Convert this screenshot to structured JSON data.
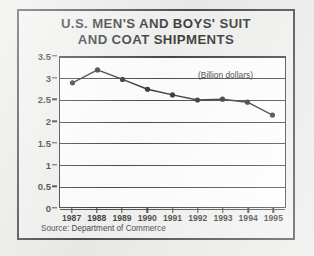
{
  "figure": {
    "title_line1": "U.S. MEN'S AND BOYS' SUIT",
    "title_line2": "AND COAT SHIPMENTS",
    "source_note": "Source:  Department of Commerce",
    "frame_color": "#26262a",
    "background_color": "#efefed",
    "page_background": "#e8e8e6",
    "line_color": "#111114"
  },
  "chart_data": {
    "type": "line",
    "title": "U.S. MEN'S AND BOYS' SUIT AND COAT SHIPMENTS",
    "subtitle": "",
    "annotation": "(Billion dollars)",
    "xlabel": "",
    "ylabel": "",
    "categories": [
      "1987",
      "1988",
      "1989",
      "1990",
      "1991",
      "1992",
      "1993",
      "1994",
      "1995"
    ],
    "values": [
      2.9,
      3.2,
      2.98,
      2.75,
      2.62,
      2.5,
      2.52,
      2.45,
      2.15
    ],
    "series": [
      {
        "name": "Shipments",
        "values": [
          2.9,
          3.2,
          2.98,
          2.75,
          2.62,
          2.5,
          2.52,
          2.45,
          2.15
        ]
      }
    ],
    "ylim": [
      0,
      3.5
    ],
    "yticks": [
      "0",
      "0.5",
      "1",
      "1.5",
      "2",
      "2.5",
      "3",
      "3.5"
    ],
    "ytick_values": [
      0,
      0.5,
      1,
      1.5,
      2,
      2.5,
      3,
      3.5
    ],
    "grid": true,
    "grid_axis": "y",
    "legend": false,
    "legend_position": "none",
    "marker": "circle",
    "units": "Billion dollars"
  }
}
